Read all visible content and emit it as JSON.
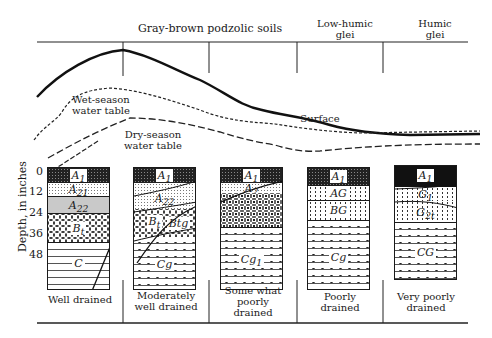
{
  "figure": {
    "soil_groups": [
      {
        "label": "Gray-brown podzolic soils"
      },
      {
        "label_line1": "Low-humic",
        "label_line2": "glei"
      },
      {
        "label_line1": "Humic",
        "label_line2": "glei"
      }
    ],
    "curve_labels": {
      "surface": "Surface",
      "wet_line1": "Wet-season",
      "wet_line2": "water table",
      "dry_line1": "Dry-season",
      "dry_line2": "water table"
    },
    "y_axis": {
      "label": "Depth, in inches",
      "ticks": [
        "0",
        "12",
        "24",
        "36",
        "48"
      ]
    },
    "profiles": [
      {
        "drainage": "Well drained",
        "horizons": [
          {
            "name": "A",
            "sub": "1"
          },
          {
            "name": "A",
            "sub": "21"
          },
          {
            "name": "A",
            "sub": "22"
          },
          {
            "name": "B",
            "sub": "t"
          },
          {
            "name": "C",
            "sub": ""
          }
        ]
      },
      {
        "drainage_line1": "Moderately",
        "drainage_line2": "well drained",
        "horizons": [
          {
            "name": "A",
            "sub": "1"
          },
          {
            "name": "A",
            "sub": "22"
          },
          {
            "name": "B",
            "sub": "t"
          },
          {
            "name": "Btg",
            "sub": ""
          },
          {
            "name": "Cg",
            "sub": ""
          }
        ]
      },
      {
        "drainage_line1": "Some what",
        "drainage_line2": "poorly",
        "drainage_line3": "drained",
        "horizons": [
          {
            "name": "A",
            "sub": "1"
          },
          {
            "name": "A",
            "sub": "2"
          },
          {
            "name": "Cg",
            "sub": "1"
          }
        ]
      },
      {
        "drainage_line1": "Poorly",
        "drainage_line2": "drained",
        "horizons": [
          {
            "name": "A",
            "sub": "1"
          },
          {
            "name": "AG",
            "sub": ""
          },
          {
            "name": "BG",
            "sub": ""
          },
          {
            "name": "Cg",
            "sub": ""
          }
        ]
      },
      {
        "drainage_line1": "Very poorly",
        "drainage_line2": "drained",
        "horizons": [
          {
            "name": "A",
            "sub": "1"
          },
          {
            "name": "G",
            "sub": "1"
          },
          {
            "name": "G",
            "sub": "2t"
          },
          {
            "name": "CG",
            "sub": ""
          }
        ]
      }
    ]
  }
}
